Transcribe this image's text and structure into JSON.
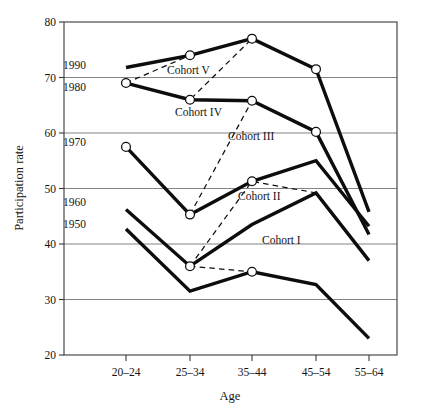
{
  "chart_data": {
    "type": "line",
    "title": "",
    "xlabel": "Age",
    "ylabel": "Participation rate",
    "ylim": [
      20,
      80
    ],
    "yticks": [
      20,
      30,
      40,
      50,
      60,
      70,
      80
    ],
    "grid": "horizontal",
    "legend": "inline-labels",
    "categories": [
      "20–24",
      "25–34",
      "35–44",
      "45–54",
      "55–64"
    ],
    "series": [
      {
        "name": "1990",
        "style": "solid",
        "label_x_category": "20–24",
        "values": [
          71.8,
          74.0,
          77.0,
          71.5,
          45.8
        ]
      },
      {
        "name": "1980",
        "style": "solid",
        "label_x_category": "20–24",
        "values": [
          69.0,
          66.0,
          65.8,
          60.2,
          41.7
        ]
      },
      {
        "name": "1970",
        "style": "solid",
        "label_x_category": "20–24",
        "values": [
          57.5,
          45.3,
          51.3,
          55.0,
          43.2
        ]
      },
      {
        "name": "1960",
        "style": "solid",
        "label_x_category": "20–24",
        "values": [
          46.2,
          36.0,
          43.5,
          49.2,
          37.0
        ]
      },
      {
        "name": "1950",
        "style": "solid",
        "label_x_category": "20–24",
        "values": [
          42.7,
          31.5,
          35.0,
          32.7,
          23.0
        ]
      }
    ],
    "cohorts": [
      {
        "name": "Cohort I",
        "style": "dashed",
        "points": [
          {
            "x": "25–34",
            "y": 36.0
          },
          {
            "x": "35–44",
            "y": 35.0
          }
        ]
      },
      {
        "name": "Cohort II",
        "style": "dashed",
        "points": [
          {
            "x": "25–34",
            "y": 36.0
          },
          {
            "x": "35–44",
            "y": 51.3
          },
          {
            "x": "45–54",
            "y": 49.2
          }
        ]
      },
      {
        "name": "Cohort III",
        "style": "dashed",
        "points": [
          {
            "x": "25–34",
            "y": 45.3
          },
          {
            "x": "35–44",
            "y": 65.8
          },
          {
            "x": "45–54",
            "y": 60.2
          }
        ]
      },
      {
        "name": "Cohort IV",
        "style": "dashed",
        "points": [
          {
            "x": "20–24",
            "y": 69.0
          },
          {
            "x": "25–34",
            "y": 66.0
          },
          {
            "x": "35–44",
            "y": 77.0
          },
          {
            "x": "45–54",
            "y": 71.5
          }
        ]
      },
      {
        "name": "Cohort V",
        "style": "dashed",
        "points": [
          {
            "x": "20–24",
            "y": 69.0
          },
          {
            "x": "25–34",
            "y": 74.0
          },
          {
            "x": "35–44",
            "y": 77.0
          }
        ]
      }
    ],
    "markers": [
      {
        "x": "20–24",
        "y": 69.0
      },
      {
        "x": "20–24",
        "y": 57.5
      },
      {
        "x": "25–34",
        "y": 74.0
      },
      {
        "x": "25–34",
        "y": 66.0
      },
      {
        "x": "25–34",
        "y": 45.3
      },
      {
        "x": "25–34",
        "y": 36.0
      },
      {
        "x": "35–44",
        "y": 77.0
      },
      {
        "x": "35–44",
        "y": 65.8
      },
      {
        "x": "35–44",
        "y": 51.3
      },
      {
        "x": "35–44",
        "y": 35.0
      },
      {
        "x": "45–54",
        "y": 71.5
      },
      {
        "x": "45–54",
        "y": 60.2
      }
    ],
    "cohort_label_positions": [
      {
        "name": "Cohort I",
        "x": 262,
        "y": 244
      },
      {
        "name": "Cohort II",
        "x": 238,
        "y": 200
      },
      {
        "name": "Cohort III",
        "x": 228,
        "y": 140
      },
      {
        "name": "Cohort IV",
        "x": 175,
        "y": 116
      },
      {
        "name": "Cohort V",
        "x": 167,
        "y": 74
      }
    ],
    "series_label_positions": [
      {
        "name": "1990",
        "x": 63,
        "y": 69
      },
      {
        "name": "1980",
        "x": 63,
        "y": 91
      },
      {
        "name": "1970",
        "x": 63,
        "y": 146
      },
      {
        "name": "1960",
        "x": 63,
        "y": 206
      },
      {
        "name": "1950",
        "x": 63,
        "y": 228
      }
    ]
  }
}
